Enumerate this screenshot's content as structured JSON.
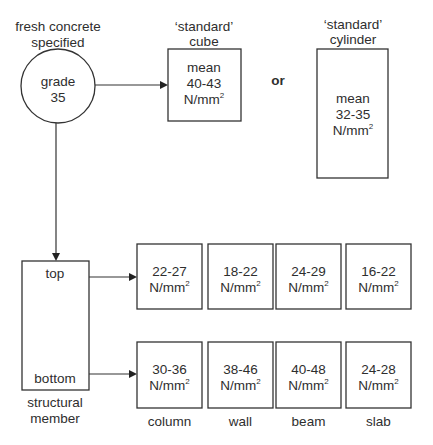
{
  "specified": {
    "caption_lines": [
      "fresh concrete",
      "specified"
    ],
    "grade_lines": [
      "grade",
      "35"
    ]
  },
  "cube": {
    "caption_lines": [
      "‘standard’",
      "cube"
    ],
    "text_lines": [
      "mean",
      "40-43",
      "N/mm"
    ],
    "unit_sup": "2"
  },
  "connector": "or",
  "cylinder": {
    "caption_lines": [
      "‘standard’",
      "cylinder"
    ],
    "text_lines": [
      "mean",
      "32-35",
      "N/mm"
    ],
    "unit_sup": "2"
  },
  "member": {
    "top_label": "top",
    "bottom_label": "bottom",
    "caption_lines": [
      "structural",
      "member"
    ]
  },
  "unit": "N/mm",
  "unit_sup": "2",
  "members": [
    {
      "name": "column",
      "top": "22-27",
      "bottom": "30-36"
    },
    {
      "name": "wall",
      "top": "18-22",
      "bottom": "38-46"
    },
    {
      "name": "beam",
      "top": "24-29",
      "bottom": "40-48"
    },
    {
      "name": "slab",
      "top": "16-22",
      "bottom": "24-28"
    }
  ]
}
